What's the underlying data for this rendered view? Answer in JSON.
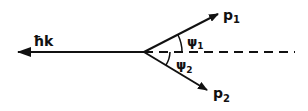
{
  "diagram": {
    "type": "vector-diagram",
    "vectors": [
      {
        "id": "hk",
        "label": "ħk",
        "direction": "left"
      },
      {
        "id": "p1",
        "label": "p",
        "subscript": "1",
        "direction": "up-right"
      },
      {
        "id": "p2",
        "label": "p",
        "subscript": "2",
        "direction": "down-right"
      }
    ],
    "angles": [
      {
        "id": "psi1",
        "label": "ψ",
        "subscript": "1",
        "between": [
          "p1",
          "axis"
        ]
      },
      {
        "id": "psi2",
        "label": "ψ",
        "subscript": "2",
        "between": [
          "p2",
          "axis"
        ]
      }
    ],
    "axis": {
      "style": "dashed",
      "direction": "right"
    },
    "colors": {
      "ink": "#111111",
      "background": "#ffffff"
    }
  }
}
